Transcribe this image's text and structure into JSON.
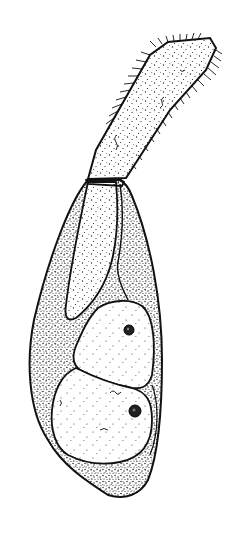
{
  "figure": {
    "type": "scientific-illustration",
    "style": "stippled pen-and-ink line drawing",
    "colors": {
      "background": "#ffffff",
      "ink": "#111111"
    },
    "parts": [
      {
        "name": "distal-segment",
        "description": "elongated bristled segment angled up-right"
      },
      {
        "name": "connecting-segment",
        "description": "short segment joining distal and basal parts"
      },
      {
        "name": "basal-segment",
        "description": "large teardrop-shaped stippled body"
      },
      {
        "name": "inner-lobe",
        "description": "elongated inner lobe in upper basal segment"
      },
      {
        "name": "upper-cell",
        "description": "rounded cell with small dark nucleus"
      },
      {
        "name": "lower-cell",
        "description": "larger rounded cell with dark nucleus"
      }
    ]
  }
}
